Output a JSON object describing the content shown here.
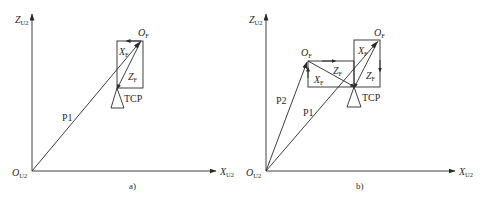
{
  "diagram": {
    "colors": {
      "stroke": "#2a2a2a",
      "background": "#ffffff"
    },
    "panel_a": {
      "caption": "a)",
      "axes": {
        "z_label": "Z",
        "z_sub": "U2",
        "x_label": "X",
        "x_sub": "U2",
        "origin_label": "O",
        "origin_sub": "U2"
      },
      "frame_origin_label": "O",
      "frame_origin_sub": "F",
      "frame_x_label": "X",
      "frame_x_sub": "F",
      "frame_z_label": "Z",
      "frame_z_sub": "F",
      "tcp_label": "TCP",
      "vector_label": "P1"
    },
    "panel_b": {
      "caption": "b)",
      "axes": {
        "z_label": "Z",
        "z_sub": "U2",
        "x_label": "X",
        "x_sub": "U2",
        "origin_label": "O",
        "origin_sub": "U2"
      },
      "frame1": {
        "origin_label": "O",
        "origin_sub": "F",
        "x_label": "X",
        "x_sub": "F",
        "z_label": "Z",
        "z_sub": "F"
      },
      "frame2": {
        "origin_label": "O",
        "origin_sub": "F",
        "x_label": "X",
        "x_sub": "F",
        "z_label": "Z",
        "z_sub": "F"
      },
      "tcp_label": "TCP",
      "vector1_label": "P1",
      "vector2_label": "P2"
    }
  }
}
